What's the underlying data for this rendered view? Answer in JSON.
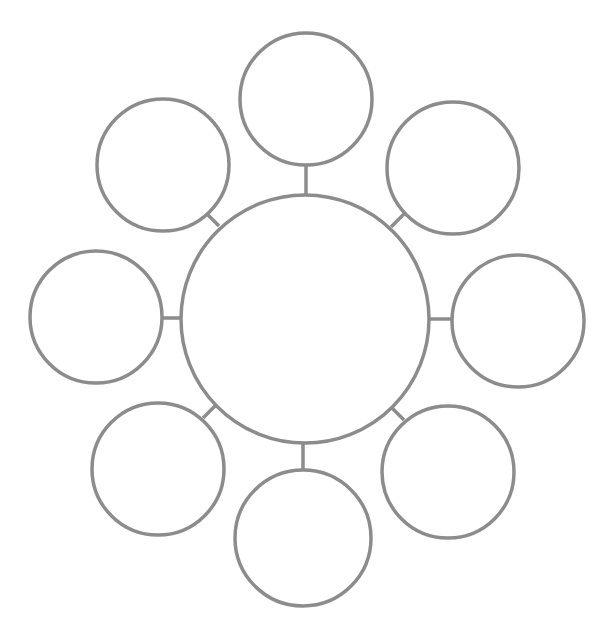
{
  "diagram": {
    "type": "bubble-map",
    "stroke_color": "#8c8c8c",
    "background_color": "#ffffff",
    "center": {
      "label": "",
      "cx": 305,
      "cy": 319,
      "r": 124
    },
    "satellites": [
      {
        "id": "top",
        "label": "",
        "cx": 306,
        "cy": 99,
        "r": 66
      },
      {
        "id": "top-right",
        "label": "",
        "cx": 453,
        "cy": 168,
        "r": 66
      },
      {
        "id": "right",
        "label": "",
        "cx": 518,
        "cy": 321,
        "r": 66
      },
      {
        "id": "bottom-right",
        "label": "",
        "cx": 448,
        "cy": 472,
        "r": 66
      },
      {
        "id": "bottom",
        "label": "",
        "cx": 303,
        "cy": 538,
        "r": 68
      },
      {
        "id": "bottom-left",
        "label": "",
        "cx": 158,
        "cy": 469,
        "r": 66
      },
      {
        "id": "left",
        "label": "",
        "cx": 96,
        "cy": 317,
        "r": 66
      },
      {
        "id": "top-left",
        "label": "",
        "cx": 163,
        "cy": 165,
        "r": 66
      }
    ],
    "connectors": [
      {
        "to": "top",
        "x1": 306,
        "y1": 165,
        "x2": 306,
        "y2": 195
      },
      {
        "to": "top-right",
        "x1": 404,
        "y1": 214,
        "x2": 391,
        "y2": 227
      },
      {
        "to": "right",
        "x1": 428,
        "y1": 319,
        "x2": 452,
        "y2": 319
      },
      {
        "to": "bottom-right",
        "x1": 392,
        "y1": 408,
        "x2": 404,
        "y2": 420
      },
      {
        "to": "bottom",
        "x1": 303,
        "y1": 443,
        "x2": 303,
        "y2": 470
      },
      {
        "to": "bottom-left",
        "x1": 216,
        "y1": 405,
        "x2": 203,
        "y2": 418
      },
      {
        "to": "left",
        "x1": 162,
        "y1": 318,
        "x2": 182,
        "y2": 318
      },
      {
        "to": "top-left",
        "x1": 207,
        "y1": 214,
        "x2": 219,
        "y2": 226
      }
    ]
  }
}
